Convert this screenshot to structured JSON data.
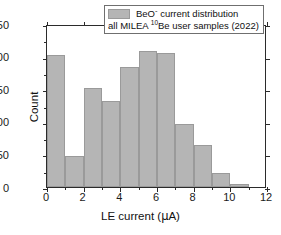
{
  "chart_data": {
    "type": "bar",
    "title": "",
    "subtitle": "",
    "xlabel": "LE current (µA)",
    "ylabel": "Count",
    "xlim": [
      0,
      12
    ],
    "ylim": [
      0,
      250
    ],
    "grid": false,
    "bin_width": 1,
    "bin_edges": [
      0,
      1,
      2,
      3,
      4,
      5,
      6,
      7,
      8,
      9,
      10,
      11
    ],
    "categories": [
      "0–1",
      "1–2",
      "2–3",
      "3–4",
      "4–5",
      "5–6",
      "6–7",
      "7–8",
      "8–9",
      "9–10",
      "10–11"
    ],
    "values": [
      202,
      47,
      152,
      132,
      184,
      208,
      206,
      96,
      64,
      21,
      4
    ],
    "x_ticks": [
      0,
      2,
      4,
      6,
      8,
      10,
      12
    ],
    "x_tick_labels": [
      "0",
      "2",
      "4",
      "6",
      "8",
      "10",
      "12"
    ],
    "x_minor_ticks": [
      1,
      3,
      5,
      7,
      9,
      11
    ],
    "y_ticks": [
      0,
      50,
      100,
      150,
      200,
      250
    ],
    "y_tick_labels": [
      "0",
      "50",
      "100",
      "150",
      "200",
      "250"
    ],
    "y_minor_ticks": [
      25,
      75,
      125,
      175,
      225
    ],
    "legend_position": "top-center",
    "series": [
      {
        "name": "BeO⁻ current distribution",
        "color": "#b5b5b5",
        "edge_color": "#9a9a9a",
        "values": [
          202,
          47,
          152,
          132,
          184,
          208,
          206,
          96,
          64,
          21,
          4
        ]
      }
    ]
  },
  "legend": {
    "line1_pre": "BeO",
    "line1_sup": "-",
    "line1_post": " current distribution",
    "line2_pre": "all MILEA ",
    "line2_sup": "10",
    "line2_post": "Be user samples (2022)",
    "swatch_color": "#b5b5b5"
  },
  "axes": {
    "x_title_pre": "LE current (",
    "x_title_mu": "µ",
    "x_title_post": "A)",
    "y_title": "Count"
  },
  "colors": {
    "bar_fill": "#b5b5b5",
    "bar_edge": "#9a9a9a",
    "axis": "#2b2b2b",
    "background": "#ffffff",
    "text": "#111111"
  }
}
